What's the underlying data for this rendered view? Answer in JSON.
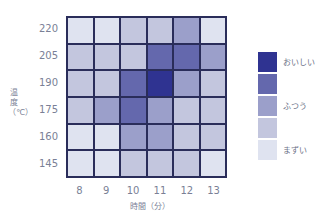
{
  "chart_data": {
    "type": "heatmap",
    "title": "",
    "xlabel": "時間（分）",
    "ylabel": "温度（℃）",
    "x": [
      "8",
      "9",
      "10",
      "11",
      "12",
      "13"
    ],
    "y": [
      "220",
      "205",
      "190",
      "175",
      "160",
      "145"
    ],
    "values": [
      [
        1,
        1,
        2,
        2,
        3,
        1
      ],
      [
        2,
        2,
        2,
        4,
        4,
        3
      ],
      [
        2,
        2,
        4,
        5,
        3,
        2
      ],
      [
        2,
        3,
        4,
        3,
        2,
        2
      ],
      [
        1,
        1,
        3,
        3,
        2,
        2
      ],
      [
        1,
        1,
        2,
        2,
        2,
        1
      ]
    ],
    "scale": {
      "min": 1,
      "max": 5,
      "colors": [
        "#dfe3f0",
        "#c3c6de",
        "#9b9fca",
        "#6468ad",
        "#2f3391"
      ]
    },
    "legend": [
      {
        "label": "おいしい",
        "level": 5
      },
      {
        "label": "",
        "level": 4
      },
      {
        "label": "ふつう",
        "level": 3
      },
      {
        "label": "",
        "level": 2
      },
      {
        "label": "まずい",
        "level": 1
      }
    ],
    "legend_position": "right",
    "grid": true
  }
}
